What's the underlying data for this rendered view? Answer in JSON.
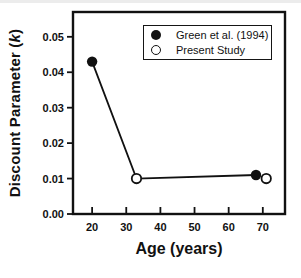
{
  "figure": {
    "background": "#ffffff",
    "ink_color": "#111111"
  },
  "chart_data": {
    "type": "line",
    "title": "",
    "xlabel": "Age (years)",
    "ylabel": "Discount Parameter (k)",
    "ylabel_prefix": "Discount Parameter (",
    "ylabel_var": "k",
    "ylabel_suffix": ")",
    "xlim": [
      14.4,
      76.5
    ],
    "ylim": [
      0,
      0.057
    ],
    "x_ticks": [
      20,
      30,
      40,
      50,
      60,
      70
    ],
    "y_ticks": [
      0,
      0.01,
      0.02,
      0.03,
      0.04,
      0.05
    ],
    "y_tick_labels": [
      "0.00",
      "0.01",
      "0.02",
      "0.03",
      "0.04",
      "0.05"
    ],
    "grid": false,
    "legend_position": "top-right-inside",
    "series": [
      {
        "name": "Green et al. (1994)",
        "marker": "filled-circle",
        "points": [
          [
            20,
            0.043
          ],
          [
            68,
            0.011
          ]
        ]
      },
      {
        "name": "Present Study",
        "marker": "open-circle",
        "points": [
          [
            33,
            0.01
          ],
          [
            71,
            0.01
          ]
        ]
      }
    ],
    "connecting_line": [
      [
        20,
        0.043
      ],
      [
        33,
        0.01
      ],
      [
        68,
        0.011
      ]
    ]
  }
}
